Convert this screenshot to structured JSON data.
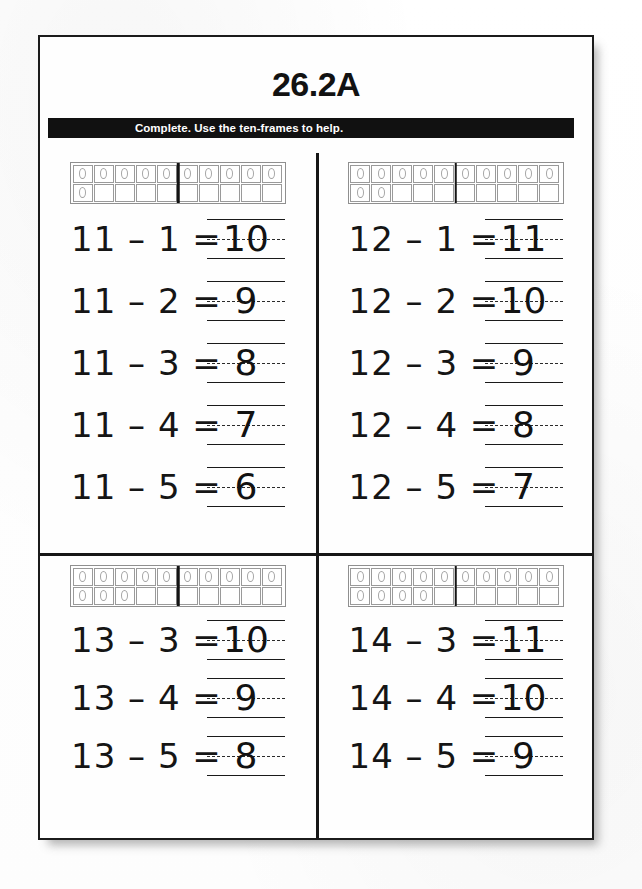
{
  "worksheet": {
    "title": "26.2A",
    "instruction": "Complete. Use the ten-frames to help.",
    "operator": "–",
    "equals": "="
  },
  "quadrants": [
    {
      "id": "top-left",
      "tenframe": {
        "label": "ten-frame-11",
        "total": 11,
        "top_row_filled": 10,
        "bottom_row_filled": 1,
        "columns": 10,
        "divider_after_column": 5
      },
      "equations": [
        {
          "minuend": "11",
          "subtrahend": "1",
          "answer": "10"
        },
        {
          "minuend": "11",
          "subtrahend": "2",
          "answer": "9"
        },
        {
          "minuend": "11",
          "subtrahend": "3",
          "answer": "8"
        },
        {
          "minuend": "11",
          "subtrahend": "4",
          "answer": "7"
        },
        {
          "minuend": "11",
          "subtrahend": "5",
          "answer": "6"
        }
      ]
    },
    {
      "id": "top-right",
      "tenframe": {
        "label": "ten-frame-12",
        "total": 12,
        "top_row_filled": 10,
        "bottom_row_filled": 2,
        "columns": 10,
        "divider_after_column": 5
      },
      "equations": [
        {
          "minuend": "12",
          "subtrahend": "1",
          "answer": "11"
        },
        {
          "minuend": "12",
          "subtrahend": "2",
          "answer": "10"
        },
        {
          "minuend": "12",
          "subtrahend": "3",
          "answer": "9"
        },
        {
          "minuend": "12",
          "subtrahend": "4",
          "answer": "8"
        },
        {
          "minuend": "12",
          "subtrahend": "5",
          "answer": "7"
        }
      ]
    },
    {
      "id": "bottom-left",
      "tenframe": {
        "label": "ten-frame-13",
        "total": 13,
        "top_row_filled": 10,
        "bottom_row_filled": 3,
        "columns": 10,
        "divider_after_column": 5
      },
      "equations": [
        {
          "minuend": "13",
          "subtrahend": "3",
          "answer": "10"
        },
        {
          "minuend": "13",
          "subtrahend": "4",
          "answer": "9"
        },
        {
          "minuend": "13",
          "subtrahend": "5",
          "answer": "8"
        }
      ]
    },
    {
      "id": "bottom-right",
      "tenframe": {
        "label": "ten-frame-14",
        "total": 14,
        "top_row_filled": 10,
        "bottom_row_filled": 4,
        "columns": 10,
        "divider_after_column": 5
      },
      "equations": [
        {
          "minuend": "14",
          "subtrahend": "3",
          "answer": "11"
        },
        {
          "minuend": "14",
          "subtrahend": "4",
          "answer": "10"
        },
        {
          "minuend": "14",
          "subtrahend": "5",
          "answer": "9"
        }
      ]
    }
  ],
  "colors": {
    "ink": "#151515",
    "bar_background": "#111111",
    "bar_text": "#ffffff",
    "frame_line": "#9a9a9a",
    "page_border": "#1b1b1b"
  }
}
